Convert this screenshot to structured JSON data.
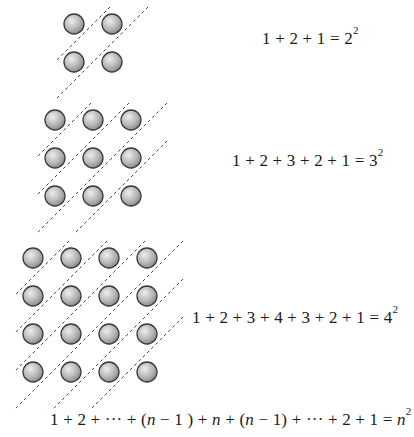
{
  "figure": {
    "colors": {
      "ball_fill_light": "#e6e6e6",
      "ball_fill_dark": "#8c8c8c",
      "ball_stroke": "#3a3a3a",
      "diagonal_stroke": "#444444",
      "text": "#1a1a1a"
    },
    "ball_radius": 10,
    "spacing": 38,
    "grids": [
      {
        "n": 2,
        "origin": [
          74,
          24
        ],
        "equation": {
          "lhs": "1 + 2 + 1 = ",
          "base": "2",
          "exp": "2"
        }
      },
      {
        "n": 3,
        "origin": [
          55,
          120
        ],
        "equation": {
          "lhs": "1 + 2 + 3 + 2 + 1 =  ",
          "base": "3",
          "exp": "2"
        }
      },
      {
        "n": 4,
        "origin": [
          33,
          258
        ],
        "equation": {
          "lhs": "1 + 2 + 3 + 4 + 3 + 2 + 1 =  ",
          "base": "4",
          "exp": "2"
        }
      }
    ],
    "general": {
      "part1": "1 + 2 + ··· + (",
      "n1": "n",
      "part2": " − 1 ) + ",
      "n2": "n",
      "part3": " + (",
      "n3": "n",
      "part4": " − 1) + ··· + 2 + 1  =  ",
      "n4": "n",
      "exp": "2"
    }
  }
}
